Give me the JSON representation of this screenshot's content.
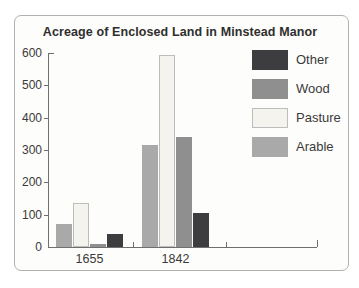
{
  "frame": {
    "border_color": "#b3b1ad",
    "background": "#fdfdfb"
  },
  "chart_data": {
    "type": "bar",
    "title": "Acreage of Enclosed Land in Minstead Manor",
    "xlabel": "",
    "ylabel": "",
    "categories": [
      "1655",
      "1842"
    ],
    "series": [
      {
        "name": "Arable",
        "color": "#a9a9a9",
        "border_color": "",
        "values": [
          70,
          315
        ]
      },
      {
        "name": "Pasture",
        "color": "#f4f3ee",
        "border_color": "#bcbcbc",
        "values": [
          135,
          595
        ]
      },
      {
        "name": "Wood",
        "color": "#8f8f8f",
        "border_color": "",
        "values": [
          10,
          340
        ]
      },
      {
        "name": "Other",
        "color": "#3d3d3f",
        "border_color": "",
        "values": [
          40,
          105
        ]
      }
    ],
    "ylim": [
      0,
      600
    ],
    "yticks": [
      0,
      100,
      200,
      300,
      400,
      500,
      600
    ],
    "grid": false,
    "legend_position": "right",
    "legend": {
      "entries": [
        "Other",
        "Wood",
        "Pasture",
        "Arable"
      ]
    },
    "axis_color": "#6f6f6d",
    "text_color": "#3a3a3a"
  }
}
